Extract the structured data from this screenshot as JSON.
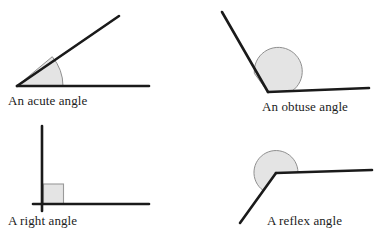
{
  "figure": {
    "background_color": "#ffffff",
    "line_color": "#1a1a1a",
    "marker_fill_color": "#e2e2e2",
    "marker_stroke_color": "#8f8f8f",
    "text_color": "#1c1c1c"
  },
  "panels": [
    {
      "id": "acute",
      "caption": "An acute angle",
      "marker_shape": "arc-sector",
      "vertex": {
        "x": 17,
        "y": 86
      },
      "rays": [
        {
          "name": "horizontal-ray",
          "to": {
            "x": 149,
            "y": 86
          }
        },
        {
          "name": "upper-ray",
          "to": {
            "x": 119,
            "y": 16
          }
        }
      ],
      "marker_radius": 46
    },
    {
      "id": "obtuse",
      "caption": "An obtuse angle",
      "marker_shape": "arc-sector",
      "vertex": {
        "x": 268,
        "y": 92
      },
      "rays": [
        {
          "name": "horizontal-ray",
          "to": {
            "x": 369,
            "y": 88
          }
        },
        {
          "name": "upper-left-ray",
          "to": {
            "x": 222,
            "y": 12
          }
        }
      ],
      "marker_radius": 24
    },
    {
      "id": "right",
      "caption": "A right angle",
      "marker_shape": "square",
      "vertex": {
        "x": 42,
        "y": 204
      },
      "rays": [
        {
          "name": "horizontal-ray",
          "to": {
            "x": 149,
            "y": 204
          }
        },
        {
          "name": "vertical-ray",
          "to": {
            "x": 42,
            "y": 126
          }
        }
      ],
      "marker_size": 20
    },
    {
      "id": "reflex",
      "caption": "A reflex angle",
      "marker_shape": "arc-sector",
      "vertex": {
        "x": 276,
        "y": 173
      },
      "rays": [
        {
          "name": "horizontal-ray",
          "to": {
            "x": 372,
            "y": 170
          }
        },
        {
          "name": "lower-left-ray",
          "to": {
            "x": 240,
            "y": 223
          }
        }
      ],
      "marker_radius": 22
    }
  ]
}
